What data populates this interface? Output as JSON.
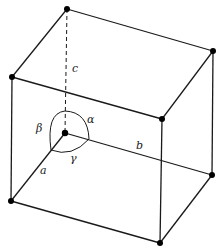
{
  "diagram": {
    "labels": {
      "a": "a",
      "b": "b",
      "c": "c",
      "alpha": "α",
      "beta": "β",
      "gamma": "γ"
    },
    "colors": {
      "line": "#1a1a1a",
      "background": "#ffffff"
    }
  }
}
